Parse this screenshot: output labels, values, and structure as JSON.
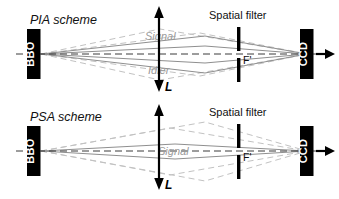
{
  "figure": {
    "width": 339,
    "height": 199,
    "background": "#ffffff",
    "type": "optical-setup-diagram",
    "panels": [
      {
        "id": "pia",
        "title": "PIA scheme",
        "source_label": "BBO",
        "detector_label": "CCD",
        "filter_title": "Spatial filter",
        "filter_point_label": "F'",
        "length_label": "L",
        "beam_labels": [
          "Signal",
          "Idler"
        ]
      },
      {
        "id": "psa",
        "title": "PSA scheme",
        "source_label": "BBO",
        "detector_label": "CCD",
        "filter_title": "Spatial filter",
        "filter_point_label": "F'",
        "length_label": "L",
        "beam_labels": [
          "Signal"
        ]
      }
    ]
  },
  "colors": {
    "ray_solid": "#8f8f8f",
    "ray_dashed": "#c2c2c2",
    "axis": "#3a3a3a",
    "block": "#000000",
    "block_text": "#ffffff",
    "beam_label": "#9a9a9a"
  }
}
